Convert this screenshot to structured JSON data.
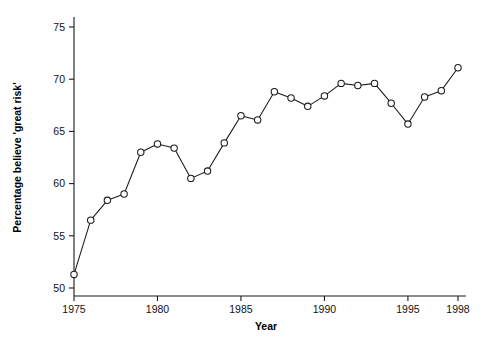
{
  "chart_data": {
    "type": "line",
    "title": "",
    "subtitle": "",
    "xlabel": "Year",
    "ylabel": "Percentage believe 'great risk'",
    "xlim": [
      1974.2,
      1998.6
    ],
    "ylim": [
      49.3,
      75.6
    ],
    "xticks": [
      1975,
      1980,
      1985,
      1990,
      1995,
      1998
    ],
    "xtick_labels": [
      "1975",
      "1980",
      "1985",
      "1990",
      "1995",
      "1998"
    ],
    "yticks": [
      50,
      55,
      60,
      65,
      70,
      75
    ],
    "ytick_labels": [
      "50",
      "55",
      "60",
      "65",
      "70",
      "75"
    ],
    "grid": false,
    "legend": false,
    "legend_position": "none",
    "marker": "open-circle",
    "line_color": "#1a1a1a",
    "marker_fill": "#ffffff",
    "x": [
      1975,
      1976,
      1977,
      1978,
      1979,
      1980,
      1981,
      1982,
      1983,
      1984,
      1985,
      1986,
      1987,
      1988,
      1989,
      1990,
      1991,
      1992,
      1993,
      1994,
      1995,
      1996,
      1997,
      1998
    ],
    "values": [
      51.3,
      56.5,
      58.4,
      59.0,
      63.0,
      63.8,
      63.4,
      60.5,
      61.2,
      63.9,
      66.5,
      66.1,
      68.8,
      68.2,
      67.4,
      68.4,
      69.6,
      69.4,
      69.6,
      67.7,
      65.7,
      68.3,
      68.9,
      71.1
    ],
    "series": [
      {
        "name": "Percentage believe 'great risk'",
        "values": [
          51.3,
          56.5,
          58.4,
          59.0,
          63.0,
          63.8,
          63.4,
          60.5,
          61.2,
          63.9,
          66.5,
          66.1,
          68.8,
          68.2,
          67.4,
          68.4,
          69.6,
          69.4,
          69.6,
          67.7,
          65.7,
          68.3,
          68.9,
          71.1
        ]
      }
    ]
  }
}
